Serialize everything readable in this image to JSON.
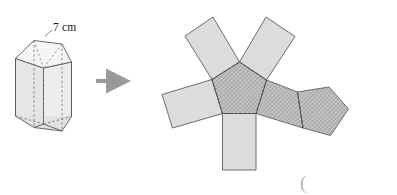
{
  "figure": {
    "type": "geometry-diagram",
    "background_color": "#ffffff"
  },
  "labels": {
    "edge_length": "7 cm",
    "stray_paren": "("
  },
  "colors": {
    "outline": "#4a4a4a",
    "fold_line": "#555555",
    "prism_face_light": "#eceded",
    "prism_face_mid": "#e2e3e3",
    "prism_face_dark": "#d7d8d8",
    "net_flap_fill": "#dcdcdc",
    "net_pentagon_fill": "#bdbdbd",
    "hatch_line": "#8f8f8f",
    "arrow": "#9a9a9a",
    "paren": "#b9b9b9"
  },
  "prism": {
    "name": "pentagonal-prism",
    "shape": "right pentagonal prism",
    "faces_visible": 3,
    "hidden_edges_style": "dashed",
    "top_pentagon": [
      [
        15.5,
        58.5
      ],
      [
        34.0,
        40.5
      ],
      [
        62.0,
        44.0
      ],
      [
        71.5,
        62.0
      ],
      [
        43.5,
        68.0
      ]
    ],
    "bottom_pentagon": [
      [
        15.5,
        116.0
      ],
      [
        34.0,
        127.5
      ],
      [
        62.0,
        131.0
      ],
      [
        71.5,
        116.5
      ],
      [
        43.5,
        124.0
      ]
    ],
    "label_anchor": [
      51,
      31
    ]
  },
  "arrow": {
    "name": "transform-arrow",
    "direction": "right",
    "from": [
      96,
      81
    ],
    "to": [
      116,
      81
    ]
  },
  "net": {
    "name": "pentagonal-prism-net",
    "description": "Central pentagon base with five rectangular lateral faces and a second pentagon base",
    "center_pentagon": [
      [
        212.0,
        79.5
      ],
      [
        239.5,
        62.0
      ],
      [
        266.5,
        80.0
      ],
      [
        256.0,
        113.5
      ],
      [
        222.5,
        113.5
      ]
    ],
    "second_pentagon": [
      [
        297.5,
        92.0
      ],
      [
        329.0,
        87.0
      ],
      [
        348.5,
        109.0
      ],
      [
        330.5,
        135.5
      ],
      [
        303.0,
        128.0
      ]
    ],
    "flaps": [
      {
        "id": "flap-top-left",
        "points": [
          [
            212.0,
            79.5
          ],
          [
            239.5,
            62.0
          ],
          [
            213.0,
            17.0
          ],
          [
            185.0,
            36.0
          ]
        ],
        "fold_edge": [
          [
            212.0,
            79.5
          ],
          [
            239.5,
            62.0
          ]
        ]
      },
      {
        "id": "flap-top-right",
        "points": [
          [
            239.5,
            62.0
          ],
          [
            266.5,
            80.0
          ],
          [
            295.0,
            36.5
          ],
          [
            266.0,
            17.0
          ]
        ],
        "fold_edge": [
          [
            239.5,
            62.0
          ],
          [
            266.5,
            80.0
          ]
        ]
      },
      {
        "id": "flap-left",
        "points": [
          [
            212.0,
            79.5
          ],
          [
            222.5,
            113.5
          ],
          [
            172.5,
            128.0
          ],
          [
            162.0,
            94.5
          ]
        ],
        "fold_edge": [
          [
            212.0,
            79.5
          ],
          [
            222.5,
            113.5
          ]
        ]
      },
      {
        "id": "flap-bottom",
        "points": [
          [
            222.5,
            113.5
          ],
          [
            256.0,
            113.5
          ],
          [
            256.0,
            170.0
          ],
          [
            222.5,
            170.0
          ]
        ],
        "fold_edge": [
          [
            222.5,
            113.5
          ],
          [
            256.0,
            113.5
          ]
        ]
      },
      {
        "id": "flap-right",
        "points": [
          [
            266.5,
            80.0
          ],
          [
            256.0,
            113.5
          ],
          [
            303.0,
            128.0
          ],
          [
            297.5,
            92.0
          ]
        ],
        "fold_edge": [
          [
            266.5,
            80.0
          ],
          [
            256.0,
            113.5
          ]
        ]
      }
    ],
    "fold_lines_dashed": true,
    "hatched_faces": [
      "center_pentagon",
      "second_pentagon",
      "flap-right"
    ]
  }
}
